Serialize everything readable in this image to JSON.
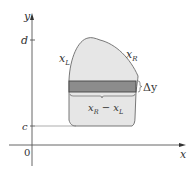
{
  "diagram": {
    "type": "region-between-curves-horizontal-strip",
    "axes": {
      "x_label": "x",
      "y_label": "y",
      "origin_label": "0"
    },
    "y_ticks": [
      {
        "label": "d",
        "position": "upper bound"
      },
      {
        "label": "c",
        "position": "lower bound"
      }
    ],
    "curve_labels": {
      "left": "x",
      "left_sub": "L",
      "right": "x",
      "right_sub": "R"
    },
    "strip": {
      "height_label": "Δy",
      "width_label_parts": [
        "x",
        "R",
        " − x",
        "L"
      ]
    },
    "colors": {
      "region_fill": "#e6e6e6",
      "strip_fill": "#8c8c8c",
      "stroke": "#555555",
      "axis": "#444444"
    }
  }
}
